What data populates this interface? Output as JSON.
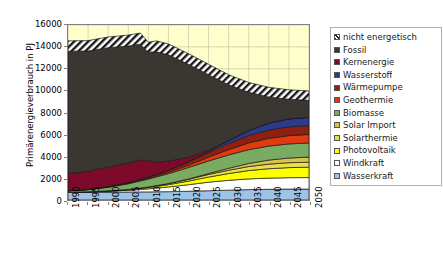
{
  "chart_data": {
    "type": "area",
    "stacked": true,
    "title": "",
    "xlabel": "",
    "ylabel": "Primärenergieverbrauch in PJ",
    "ylim": [
      0,
      16000
    ],
    "ytick_step": 2000,
    "yticks": [
      "16000",
      "14000",
      "12000",
      "10000",
      "8000",
      "6000",
      "4000",
      "2000",
      "0"
    ],
    "xlim": [
      1990,
      2050
    ],
    "xtick_step": 5,
    "xticks": [
      "1990",
      "1995",
      "2000",
      "2005",
      "2010",
      "2015",
      "2020",
      "2025",
      "2030",
      "2035",
      "2040",
      "2045",
      "2050"
    ],
    "grid": true,
    "legend_position": "right",
    "plot_background": "#ffffcc",
    "x": [
      1990,
      1995,
      2000,
      2005,
      2008,
      2010,
      2012,
      2015,
      2020,
      2025,
      2030,
      2035,
      2040,
      2045,
      2050
    ],
    "series": [
      {
        "name": "Wasserkraft",
        "color": "#9dc3e6",
        "values": [
          700,
          700,
          720,
          730,
          740,
          740,
          750,
          760,
          800,
          850,
          900,
          950,
          980,
          1000,
          1000
        ]
      },
      {
        "name": "Windkraft",
        "color": "#ffffff",
        "values": [
          10,
          30,
          80,
          160,
          230,
          280,
          340,
          430,
          600,
          780,
          900,
          980,
          1020,
          1040,
          1050
        ]
      },
      {
        "name": "Photovoltaik",
        "color": "#ffff00",
        "values": [
          2,
          8,
          20,
          45,
          80,
          110,
          150,
          210,
          330,
          470,
          620,
          760,
          860,
          920,
          950
        ]
      },
      {
        "name": "Solarthermie",
        "color": "#e8e04a",
        "values": [
          2,
          6,
          15,
          30,
          45,
          60,
          75,
          100,
          160,
          230,
          300,
          370,
          420,
          450,
          460
        ]
      },
      {
        "name": "Solar Import",
        "color": "#d9c34a",
        "values": [
          0,
          0,
          0,
          0,
          0,
          0,
          0,
          5,
          30,
          90,
          180,
          280,
          370,
          430,
          460
        ]
      },
      {
        "name": "Biomasse",
        "color": "#7aab62",
        "values": [
          120,
          200,
          330,
          520,
          650,
          720,
          800,
          900,
          1050,
          1150,
          1220,
          1260,
          1280,
          1290,
          1290
        ]
      },
      {
        "name": "Geothermie",
        "color": "#e03a10",
        "values": [
          5,
          10,
          20,
          40,
          60,
          75,
          95,
          130,
          220,
          350,
          490,
          620,
          710,
          760,
          780
        ]
      },
      {
        "name": "Wärmepumpe",
        "color": "#8f1f10",
        "values": [
          10,
          20,
          40,
          70,
          95,
          115,
          140,
          185,
          290,
          420,
          560,
          680,
          760,
          800,
          810
        ]
      },
      {
        "name": "Wasserstoff",
        "color": "#2a3a8c",
        "values": [
          0,
          0,
          0,
          0,
          0,
          0,
          0,
          0,
          20,
          100,
          260,
          450,
          620,
          720,
          760
        ]
      },
      {
        "name": "Kernenergie",
        "color": "#7d0a2a",
        "values": [
          1550,
          1650,
          1800,
          1780,
          1750,
          1520,
          1100,
          850,
          400,
          120,
          0,
          0,
          0,
          0,
          0
        ]
      },
      {
        "name": "Fossil",
        "color": "#3a3632",
        "values": [
          11200,
          11000,
          10900,
          10700,
          10600,
          9900,
          10100,
          9700,
          8500,
          6900,
          5100,
          3500,
          2400,
          1800,
          1550
        ]
      },
      {
        "name": "nicht energetisch",
        "color": "#ffffff",
        "hatch": "diagonal",
        "values": [
          950,
          950,
          980,
          1000,
          1020,
          900,
          1000,
          1000,
          980,
          950,
          920,
          900,
          880,
          870,
          860
        ]
      }
    ],
    "totals": [
      14551,
      14574,
      14905,
      15075,
      15270,
      14420,
      14550,
      14270,
      13380,
      12410,
      11450,
      10750,
      10300,
      10080,
      9970
    ]
  },
  "legend": {
    "items": [
      {
        "label": "nicht energetisch",
        "color": "#ffffff",
        "swatch": "hatched-swatch"
      },
      {
        "label": "Fossil",
        "color": "#3a3632",
        "swatch": "solid-swatch"
      },
      {
        "label": "Kernenergie",
        "color": "#7d0a2a",
        "swatch": "solid-swatch"
      },
      {
        "label": "Wasserstoff",
        "color": "#2a3a8c",
        "swatch": "solid-swatch"
      },
      {
        "label": "Wärmepumpe",
        "color": "#8f1f10",
        "swatch": "solid-swatch"
      },
      {
        "label": "Geothermie",
        "color": "#e03a10",
        "swatch": "solid-swatch"
      },
      {
        "label": "Biomasse",
        "color": "#7aab62",
        "swatch": "solid-swatch"
      },
      {
        "label": "Solar Import",
        "color": "#d9c34a",
        "swatch": "solid-swatch"
      },
      {
        "label": "Solarthermie",
        "color": "#e8e04a",
        "swatch": "solid-swatch"
      },
      {
        "label": "Photovoltaik",
        "color": "#ffff00",
        "swatch": "solid-swatch"
      },
      {
        "label": "Windkraft",
        "color": "#ffffff",
        "swatch": "solid-swatch"
      },
      {
        "label": "Wasserkraft",
        "color": "#9dc3e6",
        "swatch": "solid-swatch"
      }
    ]
  }
}
